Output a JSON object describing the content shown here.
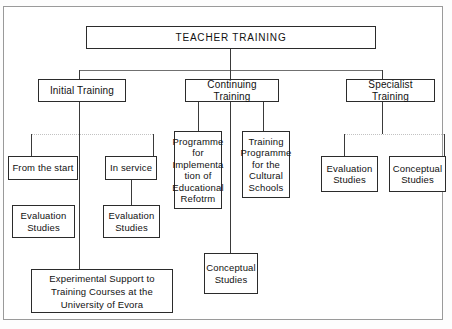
{
  "figure": {
    "type": "organizational-hierarchy-diagram",
    "title": "TEACHER TRAINING",
    "ink_color": "#2b2b2b",
    "frame_color": "#9a9a9a",
    "background_color": "#ffffff",
    "faint_connector_color": "#c2c2c2"
  },
  "nodes": {
    "root": {
      "label": "TEACHER TRAINING"
    },
    "branch_initial": {
      "label": "Initial Training"
    },
    "branch_continuing": {
      "label": "Continuing Training"
    },
    "branch_specialist": {
      "label": "Specialist Training"
    },
    "from_the_start": {
      "label": "From the start"
    },
    "in_service": {
      "label": "In service"
    },
    "eval_studies_left": {
      "label": "Evaluation\nStudies"
    },
    "eval_studies_inservice": {
      "label": "Evaluation\nStudies"
    },
    "experimental_support": {
      "label": "Experimental Support to\nTraining Courses at the\nUniversity of Evora"
    },
    "programme_reform": {
      "label": "Programme\nfor\nImplementa\ntion of\nEducational\nRefotrm"
    },
    "training_cultural": {
      "label": "Training\nProgramme\nfor the\nCultural\nSchools"
    },
    "conceptual_studies_mid": {
      "label": "Conceptual\nStudies"
    },
    "eval_studies_specialist": {
      "label": "Evaluation\nStudies"
    },
    "conceptual_studies_specialist": {
      "label": "Conceptual\nStudies"
    }
  },
  "hierarchy": {
    "root_children": [
      "Initial Training",
      "Continuing Training",
      "Specialist Training"
    ],
    "initial_training_children": [
      "From the start",
      "In service",
      "Experimental Support to Training Courses at the University of Evora"
    ],
    "from_the_start_children": [
      "Evaluation Studies"
    ],
    "in_service_children": [
      "Evaluation Studies"
    ],
    "continuing_training_children": [
      "Programme for Implementation of Educational Refotrm",
      "Training Programme for the Cultural Schools",
      "Conceptual Studies"
    ],
    "specialist_training_children": [
      "Evaluation Studies",
      "Conceptual Studies"
    ]
  }
}
